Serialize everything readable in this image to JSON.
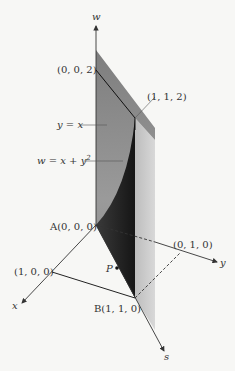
{
  "figure": {
    "axes": {
      "w": "w",
      "x": "x",
      "y": "y",
      "s": "s"
    },
    "points": {
      "p002": "(0, 0, 2)",
      "p112": "(1, 1, 2)",
      "A": "A(0, 0, 0)",
      "p010": "(0, 1, 0)",
      "p100": "(1, 0, 0)",
      "B": "B(1, 1, 0)",
      "P": "P"
    },
    "curves": {
      "line_label": "y = x",
      "surface_label_main": "w = x + y",
      "surface_label_sup": "2"
    },
    "colors": {
      "dark_pane_top": "#8a8a8a",
      "dark_pane_bottom": "#2a2a2a",
      "light_pane": "#c9c9c9",
      "background": "#f7f7f5",
      "ink": "#333333"
    }
  }
}
